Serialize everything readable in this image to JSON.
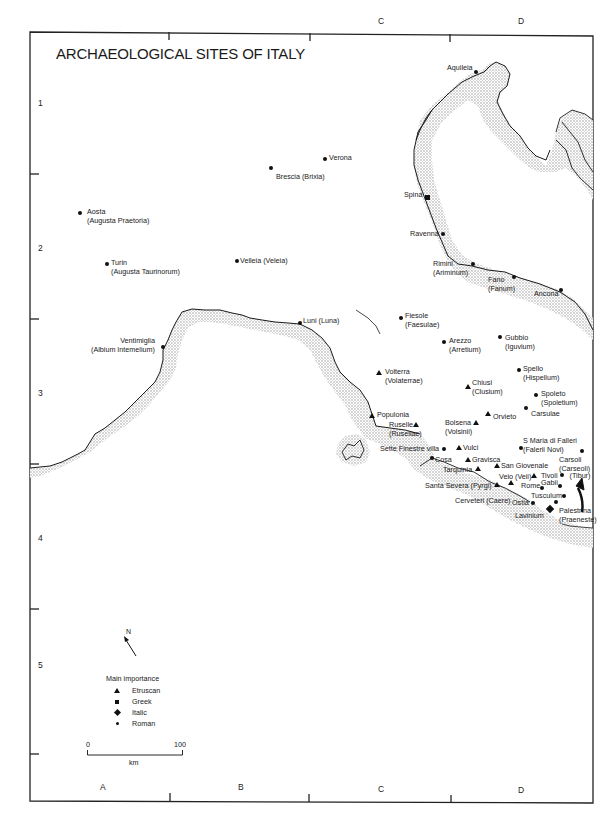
{
  "title": "ARCHAEOLOGICAL SITES OF ITALY",
  "grid": {
    "columns": [
      {
        "label": "A",
        "x": 100,
        "y": 790
      },
      {
        "label": "B",
        "x": 238,
        "y": 790
      },
      {
        "label": "C",
        "x": 378,
        "y": 16,
        "top": true
      },
      {
        "label": "C",
        "x": 378,
        "y": 792
      },
      {
        "label": "D",
        "x": 518,
        "y": 16,
        "top": true
      },
      {
        "label": "D",
        "x": 518,
        "y": 793
      }
    ],
    "rows": [
      {
        "label": "1",
        "x": 38,
        "y": 98
      },
      {
        "label": "2",
        "x": 38,
        "y": 243
      },
      {
        "label": "3",
        "x": 38,
        "y": 388
      },
      {
        "label": "4",
        "x": 38,
        "y": 533
      },
      {
        "label": "5",
        "x": 38,
        "y": 660
      }
    ]
  },
  "sites": [
    {
      "name": "Aquileia",
      "type": "roman",
      "mx": 476,
      "my": 72,
      "lx": 447,
      "ly": 63
    },
    {
      "name": "Verona",
      "type": "roman",
      "mx": 325,
      "my": 159,
      "lx": 329,
      "ly": 153
    },
    {
      "name": "Brescia (Brixia)",
      "type": "roman",
      "mx": 271,
      "my": 168,
      "lx": 276,
      "ly": 172
    },
    {
      "name": "Spina",
      "type": "greek",
      "mx": 427,
      "my": 197,
      "lx": 404,
      "ly": 190
    },
    {
      "name": "Aosta",
      "alt": "(Augusta Praetoria)",
      "type": "roman",
      "mx": 80,
      "my": 213,
      "lx": 87,
      "ly": 207
    },
    {
      "name": "Ravenna",
      "type": "roman",
      "mx": 443,
      "my": 234,
      "lx": 410,
      "ly": 229
    },
    {
      "name": "Turin",
      "alt": "(Augusta Taurinorum)",
      "type": "roman",
      "mx": 107,
      "my": 264,
      "lx": 111,
      "ly": 258
    },
    {
      "name": "Velleia (Veleia)",
      "type": "roman",
      "mx": 237,
      "my": 261,
      "lx": 240,
      "ly": 256
    },
    {
      "name": "Rimini",
      "alt": "(Ariminum)",
      "type": "roman",
      "mx": 473,
      "my": 264,
      "lx": 433,
      "ly": 259
    },
    {
      "name": "Fano",
      "alt": "(Fanum)",
      "type": "roman",
      "mx": 514,
      "my": 277,
      "lx": 488,
      "ly": 275
    },
    {
      "name": "Ancona",
      "type": "roman",
      "mx": 561,
      "my": 290,
      "lx": 534,
      "ly": 289
    },
    {
      "name": "Luni (Luna)",
      "type": "roman",
      "mx": 300,
      "my": 323,
      "lx": 303,
      "ly": 316
    },
    {
      "name": "Ventimiglia",
      "alt": "(Albium Intemelium)",
      "type": "roman",
      "mx": 163,
      "my": 347,
      "lx": 91,
      "ly": 336,
      "align": "right"
    },
    {
      "name": "Fiesole",
      "alt": "(Faesulae)",
      "type": "roman",
      "mx": 401,
      "my": 318,
      "lx": 405,
      "ly": 311
    },
    {
      "name": "Arezzo",
      "alt": "(Arretium)",
      "type": "roman",
      "mx": 444,
      "my": 342,
      "lx": 449,
      "ly": 336
    },
    {
      "name": "Gubbio",
      "alt": "(Iguvium)",
      "type": "roman",
      "mx": 500,
      "my": 337,
      "lx": 505,
      "ly": 333
    },
    {
      "name": "Volterra",
      "alt": "(Volaterrae)",
      "type": "etruscan",
      "mx": 379,
      "my": 373,
      "lx": 385,
      "ly": 367
    },
    {
      "name": "Spello",
      "alt": "(Hispellum)",
      "type": "roman",
      "mx": 519,
      "my": 370,
      "lx": 523,
      "ly": 364
    },
    {
      "name": "Chiusi",
      "alt": "(Clusium)",
      "type": "etruscan",
      "mx": 468,
      "my": 387,
      "lx": 472,
      "ly": 378
    },
    {
      "name": "Spoleto",
      "alt": "(Spoletium)",
      "type": "roman",
      "mx": 536,
      "my": 395,
      "lx": 541,
      "ly": 389
    },
    {
      "name": "Carsulae",
      "type": "roman",
      "mx": 526,
      "my": 408,
      "lx": 531,
      "ly": 409
    },
    {
      "name": "Orvieto",
      "type": "etruscan",
      "mx": 488,
      "my": 414,
      "lx": 493,
      "ly": 412
    },
    {
      "name": "Populonia",
      "type": "etruscan",
      "mx": 372,
      "my": 416,
      "lx": 377,
      "ly": 410
    },
    {
      "name": "Bolsena",
      "alt": "(Volsinii)",
      "type": "etruscan",
      "mx": 476,
      "my": 423,
      "lx": 445,
      "ly": 418
    },
    {
      "name": "Ruselle",
      "alt": "(Rusellae)",
      "type": "etruscan",
      "mx": 416,
      "my": 425,
      "lx": 389,
      "ly": 420
    },
    {
      "name": "S Maria di Falleri",
      "alt": "(Falerii Novi)",
      "type": "roman",
      "mx": 521,
      "my": 448,
      "lx": 523,
      "ly": 436
    },
    {
      "name": "Sette Finestre villa",
      "type": "roman",
      "mx": 444,
      "my": 449,
      "lx": 380,
      "ly": 444
    },
    {
      "name": "Vulci",
      "type": "etruscan",
      "mx": 459,
      "my": 448,
      "lx": 463,
      "ly": 443
    },
    {
      "name": "Carsoli",
      "alt": "(Carseoli)",
      "type": "roman",
      "mx": 582,
      "my": 451,
      "lx": 559,
      "ly": 455
    },
    {
      "name": "Cosa",
      "type": "roman",
      "mx": 432,
      "my": 458,
      "lx": 435,
      "ly": 455
    },
    {
      "name": "Gravisca",
      "type": "etruscan",
      "mx": 468,
      "my": 460,
      "lx": 472,
      "ly": 455
    },
    {
      "name": "San Giovenale",
      "type": "etruscan",
      "mx": 497,
      "my": 466,
      "lx": 501,
      "ly": 461
    },
    {
      "name": "Tarquinia",
      "type": "etruscan",
      "mx": 478,
      "my": 469,
      "lx": 443,
      "ly": 465
    },
    {
      "name": "Veio (Veii)",
      "type": "etruscan",
      "mx": 534,
      "my": 476,
      "lx": 499,
      "ly": 472
    },
    {
      "name": "Tivoli",
      "alt_inline": "(Tibur)",
      "type": "roman",
      "mx": 562,
      "my": 475,
      "lx": 541,
      "ly": 471
    },
    {
      "name": "Santa Severa (Pyrgi)",
      "type": "etruscan",
      "mx": 497,
      "my": 485,
      "lx": 425,
      "ly": 481
    },
    {
      "name": "Rome",
      "type": "roman",
      "mx": 542,
      "my": 488,
      "lx": 521,
      "ly": 481
    },
    {
      "name": "Gabii",
      "type": "roman",
      "mx": 560,
      "my": 486,
      "lx": 541,
      "ly": 478
    },
    {
      "name": "Cerveteri (Caere)",
      "type": "etruscan",
      "mx": 511,
      "my": 483,
      "lx": 455,
      "ly": 496
    },
    {
      "name": "Tusculum",
      "type": "roman",
      "mx": 564,
      "my": 496,
      "lx": 531,
      "ly": 491
    },
    {
      "name": "Ostia",
      "type": "roman",
      "mx": 533,
      "my": 503,
      "lx": 512,
      "ly": 498
    },
    {
      "name": "Palestrina",
      "alt": "(Praeneste)",
      "type": "roman",
      "mx": 556,
      "my": 502,
      "lx": 559,
      "ly": 506
    },
    {
      "name": "Lavinium",
      "type": "italic",
      "mx": 550,
      "my": 509,
      "lx": 515,
      "ly": 511
    }
  ],
  "legend": {
    "title": "Main importance",
    "items": [
      {
        "label": "Etruscan",
        "type": "etruscan"
      },
      {
        "label": "Greek",
        "type": "greek"
      },
      {
        "label": "Italic",
        "type": "italic"
      },
      {
        "label": "Roman",
        "type": "roman"
      }
    ]
  },
  "scale": {
    "start": "0",
    "end": "100",
    "unit": "km"
  },
  "north": {
    "label": "N"
  },
  "colors": {
    "ink": "#1a1a1a",
    "coast_stipple": "#b8b8b8",
    "paper": "#ffffff"
  }
}
